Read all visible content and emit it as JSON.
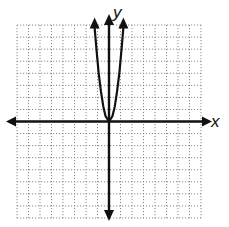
{
  "chart_data": {
    "type": "line",
    "title": "",
    "xlabel": "x",
    "ylabel": "y",
    "xlim": [
      -8,
      8
    ],
    "ylim": [
      -8,
      8
    ],
    "grid": true,
    "grid_style": "dotted",
    "tick_labels": false,
    "series": [
      {
        "name": "curve",
        "description": "Steep upward-opening parabola with vertex at origin, both arms ending in arrows near the top of the grid",
        "vertex": [
          0,
          0
        ],
        "x": [
          -1.25,
          -1.1,
          -0.9,
          -0.7,
          -0.5,
          -0.3,
          0,
          0.3,
          0.5,
          0.7,
          0.9,
          1.1,
          1.25
        ],
        "y": [
          7.8,
          6.05,
          4.05,
          2.45,
          1.25,
          0.45,
          0,
          0.45,
          1.25,
          2.45,
          4.05,
          6.05,
          7.8
        ]
      }
    ],
    "colors": {
      "axis": "#111111",
      "grid": "#8a8a8a",
      "curve": "#111111"
    }
  },
  "labels": {
    "x_axis": "x",
    "y_axis": "y"
  }
}
